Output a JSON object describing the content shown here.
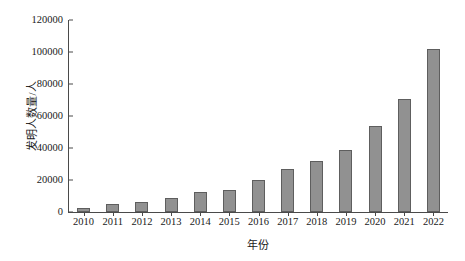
{
  "chart_data": {
    "type": "bar",
    "title": "",
    "xlabel": "年份",
    "ylabel": "发明人数量/人",
    "categories": [
      "2010",
      "2011",
      "2012",
      "2013",
      "2014",
      "2015",
      "2016",
      "2017",
      "2018",
      "2019",
      "2020",
      "2021",
      "2022"
    ],
    "values": [
      2500,
      4700,
      6000,
      8800,
      12500,
      14000,
      20300,
      27000,
      32000,
      38500,
      54000,
      70500,
      102000
    ],
    "ylim": [
      0,
      120000
    ],
    "yticks": [
      "0",
      "20000",
      "40000",
      "60000",
      "80000",
      "100000",
      "120000"
    ],
    "ytick_values": [
      0,
      20000,
      40000,
      60000,
      80000,
      100000,
      120000
    ],
    "grid": false,
    "legend": null,
    "legend_position": "none",
    "bar_color": "#919191",
    "bar_edge_color": "#5e5e5e",
    "axis_color": "#4a4a4a"
  }
}
